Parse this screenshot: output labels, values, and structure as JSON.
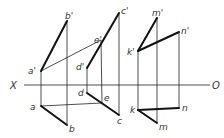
{
  "diagram": {
    "type": "orthographic-projection",
    "axis": {
      "left_label": "X",
      "right_label": "O",
      "y": 85,
      "x1": 24,
      "x2": 210
    },
    "labels": {
      "a_prime": "a'",
      "b_prime": "b'",
      "c_prime": "c'",
      "d_prime": "d'",
      "e_prime": "e'",
      "k_prime": "k'",
      "m_prime": "m'",
      "n_prime": "n'",
      "a": "a",
      "b": "b",
      "c": "c",
      "d": "d",
      "e": "e",
      "k": "k",
      "m": "m",
      "n": "n"
    },
    "points": {
      "a_prime": [
        41,
        71
      ],
      "b_prime": [
        67,
        21
      ],
      "c_prime": [
        119,
        13
      ],
      "d_prime": [
        87,
        68
      ],
      "e_prime": [
        101,
        40
      ],
      "k_prime": [
        138,
        51
      ],
      "m_prime": [
        157,
        18
      ],
      "n_prime": [
        179,
        32
      ],
      "a": [
        41,
        106
      ],
      "b": [
        67,
        125
      ],
      "c": [
        119,
        115
      ],
      "d": [
        87,
        93
      ],
      "e": [
        102,
        103
      ],
      "k": [
        138,
        110
      ],
      "m": [
        157,
        123
      ],
      "n": [
        179,
        108
      ]
    }
  }
}
